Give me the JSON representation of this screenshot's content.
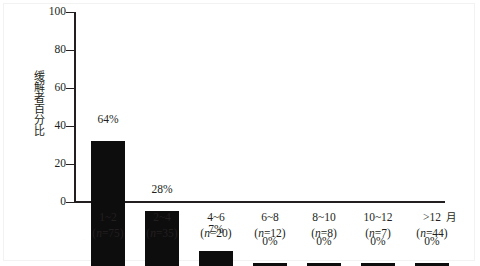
{
  "chart_data": {
    "type": "bar",
    "title": "",
    "subtitle": "",
    "xlabel": "月",
    "ylabel": "缓解者百分比",
    "categories": [
      "1~2",
      "2~4",
      "4~6",
      "6~8",
      "8~10",
      "10~12",
      ">12"
    ],
    "group_sizes": [
      "(n=75)",
      "(n=35)",
      "(n=20)",
      "(n=12)",
      "(n=8)",
      "(n=7)",
      "(n=44)"
    ],
    "values": [
      66,
      29,
      8,
      1.5,
      1.5,
      1.5,
      1.5
    ],
    "data_labels": [
      "64%",
      "28%",
      "7%",
      "0%",
      "0%",
      "0%",
      "0%"
    ],
    "ylim": [
      0,
      100
    ],
    "yticks": [
      0,
      20,
      40,
      60,
      80,
      100
    ],
    "ytick_labels": [
      "0",
      "20",
      "40",
      "60",
      "80",
      "100"
    ],
    "grid": false,
    "legend": false,
    "legend_position": "none",
    "bar_color": "#0d0d0d",
    "axis_color": "#231f20"
  },
  "axis": {
    "x_unit_label": "月",
    "y_title": "缓解者百分比"
  }
}
